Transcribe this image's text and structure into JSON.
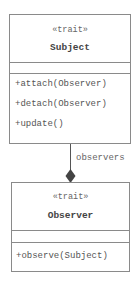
{
  "diagram": {
    "type": "uml-class-diagram",
    "classes": [
      {
        "stereotype": "«trait»",
        "name": "Subject",
        "attributes": [],
        "methods": [
          "+attach(Observer)",
          "+detach(Observer)",
          "+update()"
        ]
      },
      {
        "stereotype": "«trait»",
        "name": "Observer",
        "attributes": [],
        "methods": [
          "+observe(Subject)"
        ]
      }
    ],
    "relationship": {
      "kind": "composition",
      "from": "Subject",
      "to": "Observer",
      "label": "observers"
    },
    "colors": {
      "border": "#8a8a8a",
      "line": "#555555",
      "text": "#555555"
    }
  }
}
